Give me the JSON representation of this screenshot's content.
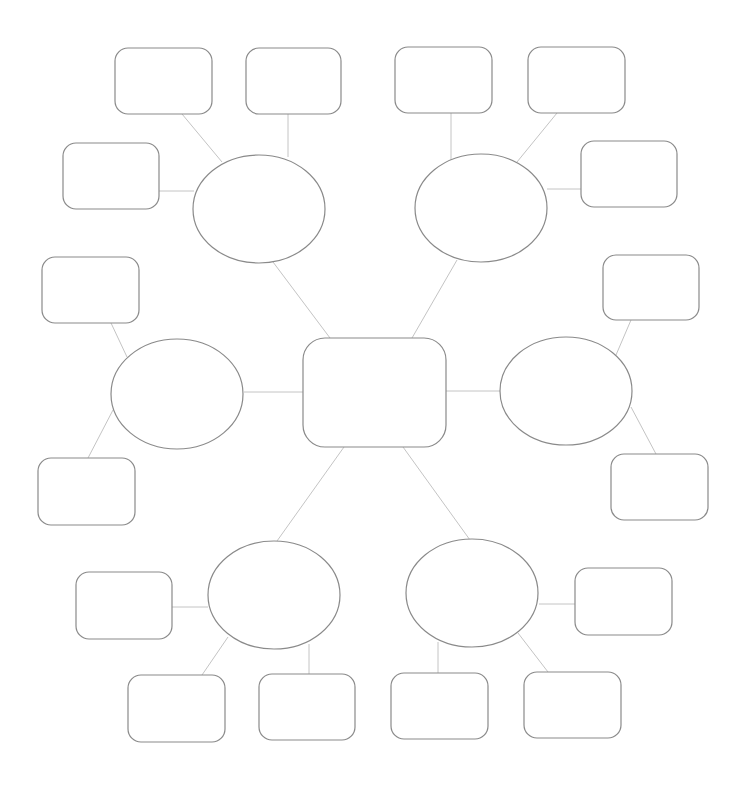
{
  "diagram": {
    "title": "",
    "type": "mind-map",
    "colors": {
      "background": "#ffffff",
      "shape_stroke": "#8a8a8a",
      "connector": "#c4c4c4"
    },
    "center": {
      "id": "center",
      "shape": "rounded-rect",
      "x": 303,
      "y": 338,
      "w": 143,
      "h": 109,
      "rx": 22,
      "label": ""
    },
    "branches": [
      {
        "id": "b-top-left",
        "shape": "ellipse",
        "cx": 259,
        "cy": 209,
        "rx": 66,
        "ry": 54,
        "label": "",
        "link": [
          330,
          338,
          273,
          262
        ],
        "leaves": [
          {
            "id": "l1",
            "x": 115,
            "y": 48,
            "w": 97,
            "h": 66,
            "label": "",
            "link": [
              222,
              162,
              182,
              114
            ]
          },
          {
            "id": "l2",
            "x": 246,
            "y": 48,
            "w": 95,
            "h": 66,
            "label": "",
            "link": [
              288,
              157,
              288,
              114
            ]
          },
          {
            "id": "l3",
            "x": 63,
            "y": 143,
            "w": 96,
            "h": 66,
            "label": "",
            "link": [
              194,
              191,
              159,
              191
            ]
          }
        ]
      },
      {
        "id": "b-top-right",
        "shape": "ellipse",
        "cx": 481,
        "cy": 208,
        "rx": 66,
        "ry": 54,
        "label": "",
        "link": [
          412,
          338,
          457,
          260
        ],
        "leaves": [
          {
            "id": "l4",
            "x": 395,
            "y": 47,
            "w": 97,
            "h": 66,
            "label": "",
            "link": [
              451,
              160,
              451,
              113
            ]
          },
          {
            "id": "l5",
            "x": 528,
            "y": 47,
            "w": 97,
            "h": 66,
            "label": "",
            "link": [
              517,
              162,
              557,
              113
            ]
          },
          {
            "id": "l6",
            "x": 581,
            "y": 141,
            "w": 96,
            "h": 66,
            "label": "",
            "link": [
              547,
              189,
              581,
              189
            ]
          }
        ]
      },
      {
        "id": "b-left",
        "shape": "ellipse",
        "cx": 177,
        "cy": 394,
        "rx": 66,
        "ry": 55,
        "label": "",
        "link": [
          244,
          392,
          303,
          392
        ],
        "leaves": [
          {
            "id": "l7",
            "x": 42,
            "y": 257,
            "w": 97,
            "h": 66,
            "label": "",
            "link": [
              127,
              357,
              111,
              323
            ]
          },
          {
            "id": "l8",
            "x": 38,
            "y": 458,
            "w": 97,
            "h": 67,
            "label": "",
            "link": [
              113,
              410,
              88,
              458
            ]
          }
        ]
      },
      {
        "id": "b-right",
        "shape": "ellipse",
        "cx": 566,
        "cy": 391,
        "rx": 66,
        "ry": 54,
        "label": "",
        "link": [
          446,
          391,
          500,
          391
        ],
        "leaves": [
          {
            "id": "l9",
            "x": 603,
            "y": 255,
            "w": 96,
            "h": 65,
            "label": "",
            "link": [
              616,
              355,
              631,
              320
            ]
          },
          {
            "id": "l10",
            "x": 611,
            "y": 454,
            "w": 97,
            "h": 66,
            "label": "",
            "link": [
              631,
              407,
              656,
              454
            ]
          }
        ]
      },
      {
        "id": "b-bottom-left",
        "shape": "ellipse",
        "cx": 274,
        "cy": 595,
        "rx": 66,
        "ry": 54,
        "label": "",
        "link": [
          344,
          447,
          277,
          541
        ],
        "leaves": [
          {
            "id": "l11",
            "x": 76,
            "y": 572,
            "w": 96,
            "h": 67,
            "label": "",
            "link": [
              172,
              607,
              208,
              607
            ]
          },
          {
            "id": "l12",
            "x": 128,
            "y": 675,
            "w": 97,
            "h": 67,
            "label": "",
            "link": [
              228,
              637,
              202,
              675
            ]
          },
          {
            "id": "l13",
            "x": 259,
            "y": 674,
            "w": 96,
            "h": 66,
            "label": "",
            "link": [
              309,
              644,
              309,
              674
            ]
          }
        ]
      },
      {
        "id": "b-bottom-right",
        "shape": "ellipse",
        "cx": 472,
        "cy": 593,
        "rx": 66,
        "ry": 54,
        "label": "",
        "link": [
          403,
          447,
          470,
          540
        ],
        "leaves": [
          {
            "id": "l14",
            "x": 575,
            "y": 568,
            "w": 97,
            "h": 67,
            "label": "",
            "link": [
              539,
              604,
              575,
              604
            ]
          },
          {
            "id": "l15",
            "x": 391,
            "y": 673,
            "w": 97,
            "h": 66,
            "label": "",
            "link": [
              438,
              642,
              438,
              673
            ]
          },
          {
            "id": "l16",
            "x": 524,
            "y": 672,
            "w": 97,
            "h": 66,
            "label": "",
            "link": [
              518,
              633,
              548,
              672
            ]
          }
        ]
      }
    ]
  }
}
